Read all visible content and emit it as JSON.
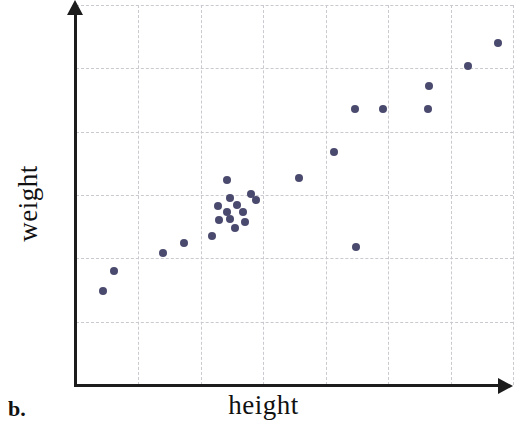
{
  "figure": {
    "part_label": "b.",
    "background_color": "#ffffff",
    "width": 517,
    "height": 431
  },
  "axes": {
    "x_label": "height",
    "y_label": "weight",
    "axis_color": "#1c1c1c",
    "grid_color": "#c9c9cf",
    "x_arrow_icon": "arrow-right-icon",
    "y_arrow_icon": "arrow-up-icon"
  },
  "chart_data": {
    "type": "scatter",
    "title": "",
    "xlabel": "height",
    "ylabel": "weight",
    "grid": true,
    "legend": "none",
    "marker_color": "#4a4a6e",
    "marker_size": 8,
    "xlim": [
      0,
      7
    ],
    "ylim": [
      0,
      6
    ],
    "x_ticks": [
      0,
      1,
      2,
      3,
      4,
      5,
      6,
      7
    ],
    "y_ticks": [
      0,
      1,
      2,
      3,
      4,
      5,
      6
    ],
    "x_tick_labels": [],
    "y_tick_labels": [],
    "n_points": 26,
    "points": [
      {
        "x": 0.43,
        "y": 1.49
      },
      {
        "x": 0.6,
        "y": 1.81
      },
      {
        "x": 1.38,
        "y": 2.09
      },
      {
        "x": 1.71,
        "y": 2.25
      },
      {
        "x": 2.16,
        "y": 2.37
      },
      {
        "x": 2.52,
        "y": 2.82
      },
      {
        "x": 2.39,
        "y": 2.69
      },
      {
        "x": 2.41,
        "y": 2.57
      },
      {
        "x": 2.54,
        "y": 2.51
      },
      {
        "x": 2.68,
        "y": 2.46
      },
      {
        "x": 2.54,
        "y": 2.38
      },
      {
        "x": 2.78,
        "y": 2.62
      },
      {
        "x": 2.87,
        "y": 2.74
      },
      {
        "x": 2.79,
        "y": 2.89
      },
      {
        "x": 2.98,
        "y": 2.83
      },
      {
        "x": 2.41,
        "y": 2.94
      },
      {
        "x": 3.03,
        "y": 3.04
      },
      {
        "x": 2.63,
        "y": 3.27
      },
      {
        "x": 3.56,
        "y": 3.3
      },
      {
        "x": 4.11,
        "y": 3.71
      },
      {
        "x": 4.45,
        "y": 2.2
      },
      {
        "x": 4.44,
        "y": 4.38
      },
      {
        "x": 4.89,
        "y": 4.38
      },
      {
        "x": 5.6,
        "y": 4.38
      },
      {
        "x": 5.58,
        "y": 4.75
      },
      {
        "x": 6.05,
        "y": 5.07
      },
      {
        "x": 6.52,
        "y": 5.43
      }
    ],
    "pixel_points": [
      {
        "px": 103,
        "py": 291
      },
      {
        "px": 114,
        "py": 271
      },
      {
        "px": 163,
        "py": 253
      },
      {
        "px": 184,
        "py": 243
      },
      {
        "px": 212,
        "py": 236
      },
      {
        "px": 227,
        "py": 180
      },
      {
        "px": 230,
        "py": 198
      },
      {
        "px": 218,
        "py": 206
      },
      {
        "px": 227,
        "py": 212
      },
      {
        "px": 219,
        "py": 220
      },
      {
        "px": 230,
        "py": 219
      },
      {
        "px": 237,
        "py": 205
      },
      {
        "px": 243,
        "py": 212
      },
      {
        "px": 235,
        "py": 228
      },
      {
        "px": 245,
        "py": 222
      },
      {
        "px": 251,
        "py": 194
      },
      {
        "px": 256,
        "py": 200
      },
      {
        "px": 299,
        "py": 178
      },
      {
        "px": 334,
        "py": 152
      },
      {
        "px": 356,
        "py": 247
      },
      {
        "px": 355,
        "py": 109
      },
      {
        "px": 383,
        "py": 109
      },
      {
        "px": 428,
        "py": 109
      },
      {
        "px": 429,
        "py": 86
      },
      {
        "px": 468,
        "py": 66
      },
      {
        "px": 498,
        "py": 43
      }
    ],
    "trend": "positive linear association",
    "annotations": []
  }
}
